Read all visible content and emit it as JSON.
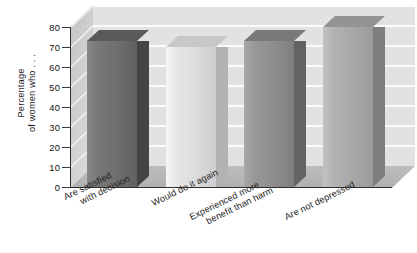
{
  "chart_data": {
    "type": "bar",
    "title": "",
    "subtitle": "",
    "xlabel": "",
    "ylabel": "Percentage of women who . . .",
    "ylabel_lines": [
      "Percentage",
      "of women who . . ."
    ],
    "categories": [
      "Are satisfied with decision",
      "Would do it again",
      "Experienced more benefit than harm",
      "Are not depressed"
    ],
    "category_lines": [
      [
        "Are satisfied",
        "with decision"
      ],
      [
        "Would do it again"
      ],
      [
        "Experienced more",
        "benefit than harm"
      ],
      [
        "Are not depressed"
      ]
    ],
    "values": [
      73,
      70,
      73,
      80
    ],
    "ylim": [
      0,
      80
    ],
    "ytick_values": [
      0,
      10,
      20,
      30,
      40,
      50,
      60,
      70,
      80
    ],
    "ytick_labels": [
      "0",
      "10",
      "20",
      "30",
      "40",
      "50",
      "60",
      "70",
      "80"
    ],
    "grid": true,
    "grid_axis": "y",
    "legend": null,
    "legend_position": "none",
    "style": "3d-bar",
    "bar_colors": [
      "#6e6e6e",
      "#dcdcdc",
      "#8d8d8d",
      "#a8a8a8"
    ],
    "plot_background": "#e2e2e2",
    "floor_color": "#b6b6b6",
    "page_background": "#ffffff"
  },
  "axis": {
    "y_title_line1": "Percentage",
    "y_title_line2": "of women who . . ."
  }
}
